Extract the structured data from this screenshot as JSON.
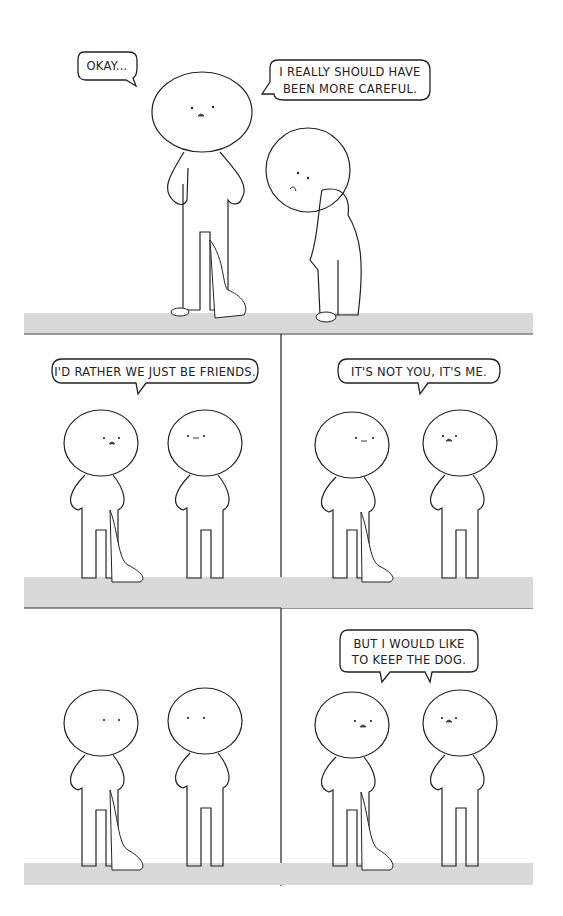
{
  "comic": {
    "panels": [
      {
        "id": 1,
        "bubbles": [
          {
            "speaker": "left-figure",
            "lines": [
              "OKAY..."
            ]
          },
          {
            "speaker": "right-figure",
            "lines": [
              "I REALLY SHOULD HAVE",
              "BEEN MORE CAREFUL."
            ]
          }
        ]
      },
      {
        "id": 2,
        "bubbles": [
          {
            "speaker": "left-figure",
            "lines": [
              "I'D RATHER WE JUST BE FRIENDS."
            ]
          }
        ]
      },
      {
        "id": 3,
        "bubbles": [
          {
            "speaker": "right-figure",
            "lines": [
              "IT'S NOT YOU, IT'S ME."
            ]
          }
        ]
      },
      {
        "id": 4,
        "bubbles": []
      },
      {
        "id": 5,
        "bubbles": [
          {
            "speaker": "both",
            "lines": [
              "BUT I WOULD LIKE",
              "TO KEEP THE DOG."
            ]
          }
        ]
      }
    ],
    "colors": {
      "background": "#ffffff",
      "ground": "#d9d9d9",
      "ink": "#222222"
    }
  }
}
